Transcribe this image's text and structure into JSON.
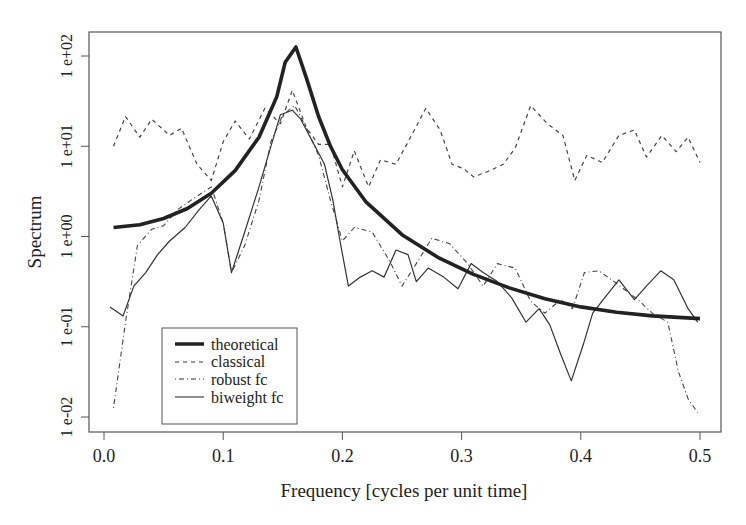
{
  "chart_data": {
    "type": "line",
    "title": "",
    "xlabel": "Frequency [cycles per unit time]",
    "ylabel": "Spectrum",
    "xlim": [
      0.0,
      0.5
    ],
    "ylim_log10": [
      -2.17,
      2.27
    ],
    "y_scale": "log",
    "grid": false,
    "legend_position": "bottom-left (inside)",
    "x_ticks": [
      {
        "value": 0.0,
        "label": "0.0"
      },
      {
        "value": 0.1,
        "label": "0.1"
      },
      {
        "value": 0.2,
        "label": "0.2"
      },
      {
        "value": 0.3,
        "label": "0.3"
      },
      {
        "value": 0.4,
        "label": "0.4"
      },
      {
        "value": 0.5,
        "label": "0.5"
      }
    ],
    "y_ticks": [
      {
        "log10": 2,
        "label": "1 e+02"
      },
      {
        "log10": 1,
        "label": "1 e+01"
      },
      {
        "log10": 0,
        "label": "1 e+00"
      },
      {
        "log10": -1,
        "label": "1 e-01"
      },
      {
        "log10": -2,
        "label": "1 e-02"
      }
    ],
    "series": [
      {
        "name": "theoretical",
        "style": "thick-solid",
        "points_log10": [
          [
            0.008,
            0.1
          ],
          [
            0.03,
            0.13
          ],
          [
            0.05,
            0.2
          ],
          [
            0.07,
            0.31
          ],
          [
            0.09,
            0.48
          ],
          [
            0.11,
            0.73
          ],
          [
            0.13,
            1.1
          ],
          [
            0.145,
            1.55
          ],
          [
            0.152,
            1.93
          ],
          [
            0.161,
            2.1
          ],
          [
            0.17,
            1.75
          ],
          [
            0.18,
            1.33
          ],
          [
            0.19,
            1.0
          ],
          [
            0.2,
            0.74
          ],
          [
            0.22,
            0.38
          ],
          [
            0.25,
            0.02
          ],
          [
            0.28,
            -0.23
          ],
          [
            0.31,
            -0.42
          ],
          [
            0.34,
            -0.57
          ],
          [
            0.37,
            -0.69
          ],
          [
            0.4,
            -0.78
          ],
          [
            0.43,
            -0.84
          ],
          [
            0.46,
            -0.88
          ],
          [
            0.5,
            -0.91
          ]
        ]
      },
      {
        "name": "classical",
        "style": "dashed",
        "points_log10": [
          [
            0.008,
            1.0
          ],
          [
            0.018,
            1.33
          ],
          [
            0.03,
            1.1
          ],
          [
            0.04,
            1.3
          ],
          [
            0.055,
            1.12
          ],
          [
            0.065,
            1.2
          ],
          [
            0.078,
            0.8
          ],
          [
            0.09,
            0.62
          ],
          [
            0.1,
            1.05
          ],
          [
            0.11,
            1.28
          ],
          [
            0.122,
            1.08
          ],
          [
            0.135,
            1.42
          ],
          [
            0.148,
            1.25
          ],
          [
            0.158,
            1.62
          ],
          [
            0.17,
            1.2
          ],
          [
            0.18,
            1.02
          ],
          [
            0.19,
            1.02
          ],
          [
            0.2,
            0.55
          ],
          [
            0.21,
            0.95
          ],
          [
            0.222,
            0.55
          ],
          [
            0.232,
            0.85
          ],
          [
            0.245,
            0.8
          ],
          [
            0.258,
            1.12
          ],
          [
            0.27,
            1.42
          ],
          [
            0.282,
            1.18
          ],
          [
            0.292,
            0.8
          ],
          [
            0.302,
            0.75
          ],
          [
            0.31,
            0.66
          ],
          [
            0.322,
            0.72
          ],
          [
            0.335,
            0.8
          ],
          [
            0.345,
            0.98
          ],
          [
            0.358,
            1.45
          ],
          [
            0.372,
            1.25
          ],
          [
            0.385,
            1.12
          ],
          [
            0.395,
            0.62
          ],
          [
            0.405,
            0.9
          ],
          [
            0.418,
            0.82
          ],
          [
            0.432,
            1.12
          ],
          [
            0.445,
            1.18
          ],
          [
            0.455,
            0.88
          ],
          [
            0.468,
            1.12
          ],
          [
            0.48,
            0.94
          ],
          [
            0.49,
            1.1
          ],
          [
            0.5,
            0.82
          ]
        ]
      },
      {
        "name": "robust fc",
        "style": "dash-dot",
        "points_log10": [
          [
            0.008,
            -1.9
          ],
          [
            0.018,
            -0.95
          ],
          [
            0.028,
            -0.1
          ],
          [
            0.04,
            0.08
          ],
          [
            0.05,
            0.12
          ],
          [
            0.062,
            0.3
          ],
          [
            0.075,
            0.42
          ],
          [
            0.09,
            0.55
          ],
          [
            0.1,
            0.15
          ],
          [
            0.107,
            -0.4
          ],
          [
            0.118,
            -0.1
          ],
          [
            0.13,
            0.4
          ],
          [
            0.14,
            1.05
          ],
          [
            0.15,
            1.35
          ],
          [
            0.16,
            1.45
          ],
          [
            0.17,
            1.2
          ],
          [
            0.18,
            0.9
          ],
          [
            0.19,
            0.4
          ],
          [
            0.2,
            -0.05
          ],
          [
            0.21,
            0.1
          ],
          [
            0.225,
            0.05
          ],
          [
            0.24,
            -0.28
          ],
          [
            0.25,
            -0.55
          ],
          [
            0.262,
            -0.3
          ],
          [
            0.275,
            -0.02
          ],
          [
            0.29,
            -0.08
          ],
          [
            0.305,
            -0.3
          ],
          [
            0.318,
            -0.55
          ],
          [
            0.33,
            -0.3
          ],
          [
            0.345,
            -0.35
          ],
          [
            0.358,
            -0.72
          ],
          [
            0.37,
            -0.85
          ],
          [
            0.383,
            -0.7
          ],
          [
            0.393,
            -0.8
          ],
          [
            0.403,
            -0.4
          ],
          [
            0.415,
            -0.38
          ],
          [
            0.428,
            -0.5
          ],
          [
            0.44,
            -0.62
          ],
          [
            0.448,
            -0.7
          ],
          [
            0.46,
            -0.85
          ],
          [
            0.473,
            -0.95
          ],
          [
            0.482,
            -1.5
          ],
          [
            0.49,
            -1.8
          ],
          [
            0.498,
            -1.95
          ]
        ]
      },
      {
        "name": "biweight fc",
        "style": "thin-solid",
        "points_log10": [
          [
            0.005,
            -0.78
          ],
          [
            0.016,
            -0.88
          ],
          [
            0.025,
            -0.55
          ],
          [
            0.035,
            -0.4
          ],
          [
            0.045,
            -0.2
          ],
          [
            0.055,
            -0.05
          ],
          [
            0.068,
            0.1
          ],
          [
            0.08,
            0.3
          ],
          [
            0.09,
            0.45
          ],
          [
            0.1,
            0.15
          ],
          [
            0.107,
            -0.4
          ],
          [
            0.118,
            0.05
          ],
          [
            0.13,
            0.55
          ],
          [
            0.14,
            1.0
          ],
          [
            0.148,
            1.35
          ],
          [
            0.158,
            1.4
          ],
          [
            0.165,
            1.3
          ],
          [
            0.175,
            1.05
          ],
          [
            0.185,
            0.8
          ],
          [
            0.192,
            0.4
          ],
          [
            0.198,
            -0.05
          ],
          [
            0.205,
            -0.55
          ],
          [
            0.215,
            -0.45
          ],
          [
            0.225,
            -0.38
          ],
          [
            0.235,
            -0.45
          ],
          [
            0.245,
            -0.15
          ],
          [
            0.255,
            -0.2
          ],
          [
            0.262,
            -0.5
          ],
          [
            0.272,
            -0.35
          ],
          [
            0.285,
            -0.45
          ],
          [
            0.297,
            -0.58
          ],
          [
            0.308,
            -0.3
          ],
          [
            0.318,
            -0.4
          ],
          [
            0.33,
            -0.5
          ],
          [
            0.342,
            -0.68
          ],
          [
            0.354,
            -0.95
          ],
          [
            0.365,
            -0.8
          ],
          [
            0.374,
            -0.98
          ],
          [
            0.383,
            -1.3
          ],
          [
            0.392,
            -1.6
          ],
          [
            0.402,
            -1.2
          ],
          [
            0.41,
            -0.85
          ],
          [
            0.42,
            -0.68
          ],
          [
            0.432,
            -0.48
          ],
          [
            0.445,
            -0.7
          ],
          [
            0.455,
            -0.55
          ],
          [
            0.467,
            -0.38
          ],
          [
            0.478,
            -0.48
          ],
          [
            0.49,
            -0.8
          ],
          [
            0.498,
            -0.95
          ]
        ]
      }
    ]
  },
  "axes": {
    "xlabel": "Frequency [cycles per unit time]",
    "ylabel": "Spectrum"
  },
  "legend": {
    "items": [
      {
        "label": "theoretical",
        "style": "thick-solid"
      },
      {
        "label": "classical",
        "style": "dashed"
      },
      {
        "label": "robust fc",
        "style": "dash-dot"
      },
      {
        "label": "biweight fc",
        "style": "thin-solid"
      }
    ]
  },
  "colors": {
    "line": "#222222",
    "axis": "#444444",
    "background": "#ffffff"
  }
}
